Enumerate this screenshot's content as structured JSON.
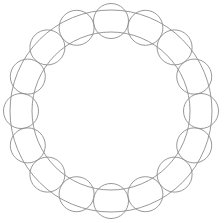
{
  "figure": {
    "background_color": "#ffffff",
    "width": 224,
    "height": 223
  },
  "chart_data": {
    "type": "diagram",
    "title": "",
    "subtitle": "",
    "xlabel": "",
    "ylabel": "",
    "legend": [],
    "annotations": [],
    "grid": false,
    "center": {
      "x": 111,
      "y": 111
    },
    "annulus": {
      "outer_radius": 101,
      "inner_radius": 79,
      "stroke_color": "#8c8c8c",
      "stroke_width": 0.9,
      "fill_color": "none"
    },
    "node_circles": {
      "count": 16,
      "radius": 17.5,
      "orbit_radius": 90,
      "start_angle_deg": -90,
      "angle_step_deg": 22.5,
      "stroke_color": "#8c8c8c",
      "stroke_width": 0.9,
      "fill_color": "none"
    },
    "nodes": [
      {
        "index": 1,
        "angle_deg": -90.0,
        "cx": 111.0,
        "cy": 21.0,
        "label": ""
      },
      {
        "index": 2,
        "angle_deg": -67.5,
        "cx": 145.4,
        "cy": 27.8,
        "label": ""
      },
      {
        "index": 3,
        "angle_deg": -45.0,
        "cx": 174.6,
        "cy": 47.4,
        "label": ""
      },
      {
        "index": 4,
        "angle_deg": -22.5,
        "cx": 194.2,
        "cy": 76.6,
        "label": ""
      },
      {
        "index": 5,
        "angle_deg": 0.0,
        "cx": 201.0,
        "cy": 111.0,
        "label": ""
      },
      {
        "index": 6,
        "angle_deg": 22.5,
        "cx": 194.2,
        "cy": 145.4,
        "label": ""
      },
      {
        "index": 7,
        "angle_deg": 45.0,
        "cx": 174.6,
        "cy": 174.6,
        "label": ""
      },
      {
        "index": 8,
        "angle_deg": 67.5,
        "cx": 145.4,
        "cy": 194.2,
        "label": ""
      },
      {
        "index": 9,
        "angle_deg": 90.0,
        "cx": 111.0,
        "cy": 201.0,
        "label": ""
      },
      {
        "index": 10,
        "angle_deg": 112.5,
        "cx": 76.6,
        "cy": 194.2,
        "label": ""
      },
      {
        "index": 11,
        "angle_deg": 135.0,
        "cx": 47.4,
        "cy": 174.6,
        "label": ""
      },
      {
        "index": 12,
        "angle_deg": 157.5,
        "cx": 27.8,
        "cy": 145.4,
        "label": ""
      },
      {
        "index": 13,
        "angle_deg": 180.0,
        "cx": 21.0,
        "cy": 111.0,
        "label": ""
      },
      {
        "index": 14,
        "angle_deg": 202.5,
        "cx": 27.8,
        "cy": 76.6,
        "label": ""
      },
      {
        "index": 15,
        "angle_deg": 225.0,
        "cx": 47.4,
        "cy": 47.4,
        "label": ""
      },
      {
        "index": 16,
        "angle_deg": 247.5,
        "cx": 76.6,
        "cy": 27.8,
        "label": ""
      }
    ]
  }
}
